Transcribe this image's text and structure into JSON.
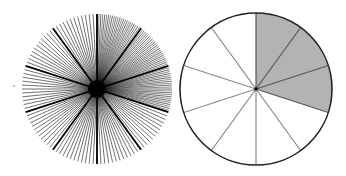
{
  "figure": {
    "left_circle": {
      "cx": 97,
      "cy": 89,
      "r": 75,
      "thin_rays": 120,
      "thick_rays": 10,
      "dense_sector_start_deg": 0,
      "dense_sector_end_deg": 108,
      "ray_color": "#111111",
      "center_dot_r": 9
    },
    "right_circle": {
      "cx": 256,
      "cy": 89,
      "r": 76,
      "sectors": 10,
      "shaded_sectors": 3,
      "shade_color": "#b3b3b3",
      "line_color": "#888888",
      "border_color": "#222222"
    }
  }
}
